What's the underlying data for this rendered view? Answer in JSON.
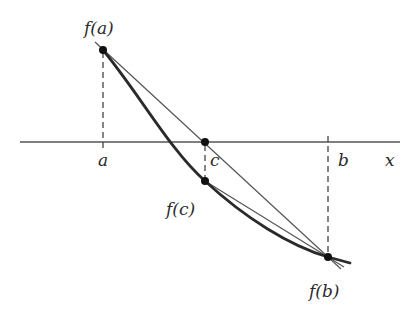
{
  "diagram": {
    "type": "secant-method-illustration",
    "colors": {
      "background": "#ffffff",
      "ink": "#2a2a2a",
      "thin_line": "#555555"
    },
    "axis": {
      "label": "x"
    },
    "points": {
      "a": {
        "axis_label": "a",
        "value_label": "f(a)"
      },
      "c": {
        "axis_label": "c",
        "value_label": "f(c)"
      },
      "b": {
        "axis_label": "b",
        "value_label": "f(b)"
      }
    }
  }
}
